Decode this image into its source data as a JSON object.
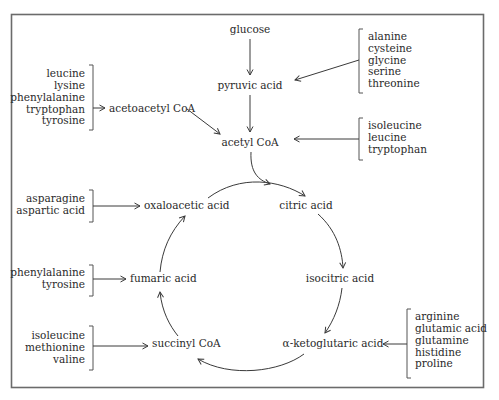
{
  "diagram": {
    "title": "",
    "nodes": {
      "glucose": "glucose",
      "pyruvic_acid": "pyruvic acid",
      "acetyl_coa": "acetyl CoA",
      "acetoacetyl_coa": "acetoacetyl CoA",
      "citric_acid": "citric acid",
      "isocitric_acid": "isocitric acid",
      "alpha_ketoglutaric_acid": "α-ketoglutaric acid",
      "succinyl_coa": "succinyl CoA",
      "fumaric_acid": "fumaric acid",
      "oxaloacetic_acid": "oxaloacetic acid"
    },
    "amino_acid_groups": {
      "to_acetoacetyl_coa": [
        "leucine",
        "lysine",
        "phenylalanine",
        "tryptophan",
        "tyrosine"
      ],
      "to_pyruvic_acid": [
        "alanine",
        "cysteine",
        "glycine",
        "serine",
        "threonine"
      ],
      "to_acetyl_coa": [
        "isoleucine",
        "leucine",
        "tryptophan"
      ],
      "to_oxaloacetic_acid": [
        "asparagine",
        "aspartic acid"
      ],
      "to_fumaric_acid": [
        "phenylalanine",
        "tyrosine"
      ],
      "to_succinyl_coa": [
        "isoleucine",
        "methionine",
        "valine"
      ],
      "to_alpha_ketoglutaric_acid": [
        "arginine",
        "glutamic acid",
        "glutamine",
        "histidine",
        "proline"
      ]
    },
    "edges": [
      [
        "glucose",
        "pyruvic acid"
      ],
      [
        "pyruvic acid",
        "acetyl CoA"
      ],
      [
        "acetoacetyl CoA",
        "acetyl CoA"
      ],
      [
        "acetyl CoA",
        "citric acid"
      ],
      [
        "oxaloacetic acid",
        "citric acid"
      ],
      [
        "citric acid",
        "isocitric acid"
      ],
      [
        "isocitric acid",
        "α-ketoglutaric acid"
      ],
      [
        "α-ketoglutaric acid",
        "succinyl CoA"
      ],
      [
        "succinyl CoA",
        "fumaric acid"
      ],
      [
        "fumaric acid",
        "oxaloacetic acid"
      ]
    ]
  }
}
